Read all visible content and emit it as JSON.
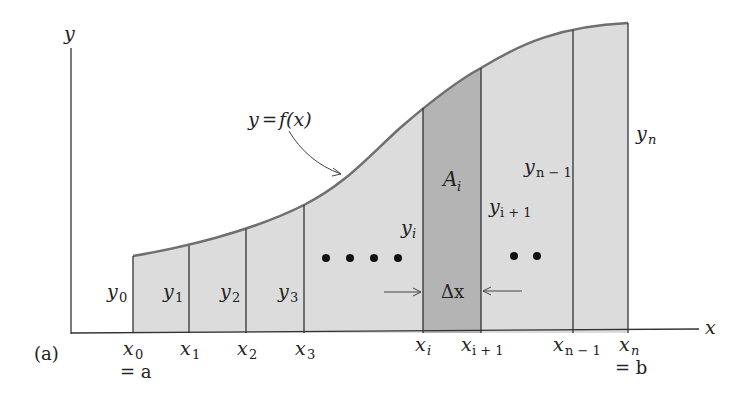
{
  "figure": {
    "panel_label": "(a)",
    "axis_labels": {
      "x": "x",
      "y": "y"
    },
    "curve_label": "y = f(x)",
    "curve_label_parts": {
      "lhs": "y",
      "eq": "=",
      "fn": "f(x)"
    },
    "highlight_label": {
      "main": "A",
      "sub": "i"
    },
    "width_label": "Δx",
    "ellipsis_dots_left": 4,
    "ellipsis_dots_right": 2,
    "colors": {
      "fill": "#dcdcdc",
      "highlight_fill": "#b4b4b4",
      "curve": "#6f6f6f",
      "lines": "#333333",
      "text": "#222222"
    }
  },
  "x_ticks": [
    {
      "main": "x",
      "sub": "0",
      "extra": "= a"
    },
    {
      "main": "x",
      "sub": "1",
      "extra": ""
    },
    {
      "main": "x",
      "sub": "2",
      "extra": ""
    },
    {
      "main": "x",
      "sub": "3",
      "extra": ""
    },
    {
      "main": "x",
      "sub": "i",
      "extra": ""
    },
    {
      "main": "x",
      "sub": "i + 1",
      "extra": ""
    },
    {
      "main": "x",
      "sub": "n − 1",
      "extra": ""
    },
    {
      "main": "x",
      "sub": "n",
      "extra": "= b"
    }
  ],
  "y_labels": [
    {
      "main": "y",
      "sub": "0"
    },
    {
      "main": "y",
      "sub": "1"
    },
    {
      "main": "y",
      "sub": "2"
    },
    {
      "main": "y",
      "sub": "3"
    },
    {
      "main": "y",
      "sub": "i"
    },
    {
      "main": "y",
      "sub": "i + 1"
    },
    {
      "main": "y",
      "sub": "n − 1"
    },
    {
      "main": "y",
      "sub": "n"
    }
  ]
}
